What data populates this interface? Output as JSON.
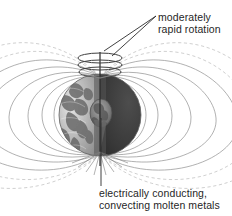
{
  "figure": {
    "background_color": "#ffffff"
  },
  "annotations": {
    "rotation": {
      "name": "moderately-rapid-rotation-label",
      "line1": "moderately",
      "line2": "rapid rotation",
      "color": "#262626"
    },
    "core": {
      "name": "electrically-conducting-core-label",
      "line1": "electrically conducting,",
      "line2": "convecting molten metals",
      "color": "#262626"
    }
  },
  "diagram": {
    "planet": {
      "name": "earth-sphere",
      "center_x": 100,
      "center_y": 115,
      "radius": 41,
      "lit_hemisphere_color": "#b9b9b9",
      "dark_hemisphere_color": "#3a3a3a",
      "terminator_color": "#6e6e6e"
    },
    "core": {
      "name": "molten-core",
      "center_x": 101,
      "center_y": 113,
      "radius_x": 11,
      "radius_y": 14,
      "color": "#8a8a8a"
    },
    "field_lines": {
      "name": "magnetic-field-lines",
      "color": "#8c8c8c",
      "dashed_color": "#b5b5b5",
      "count": 16,
      "north_pole_x": 100,
      "north_pole_y": 76,
      "south_pole_x": 100,
      "south_pole_y": 154
    },
    "rotation_rings": {
      "name": "rotation-rings",
      "count": 3,
      "color": "#4a4a4a",
      "center_x": 100,
      "top_y": 56,
      "ring_spacing": 7,
      "ring_radius_x": 22,
      "ring_radius_y": 5
    },
    "rotation_axis": {
      "name": "rotation-axis",
      "color": "#2b2b2b",
      "x": 100,
      "y_top": 52,
      "y_bottom": 165
    },
    "leader_lines": {
      "name": "leader-lines",
      "color": "#2b2b2b"
    }
  }
}
